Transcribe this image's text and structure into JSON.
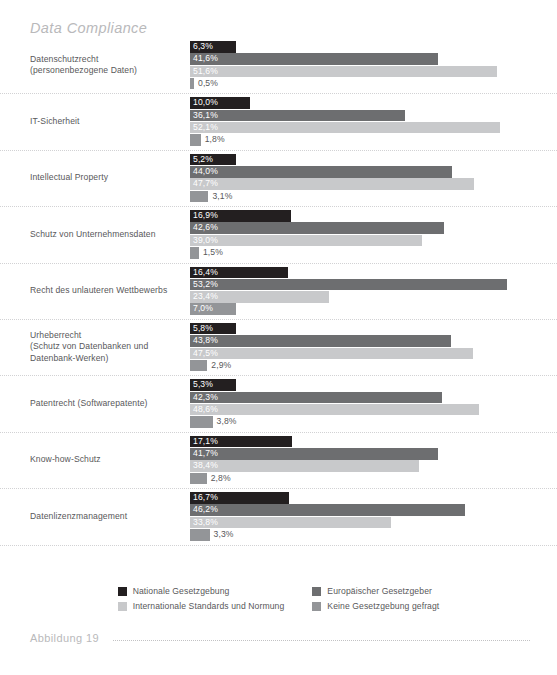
{
  "chart_title": "Data Compliance",
  "footer": {
    "label": "Abbildung 19"
  },
  "legend": {
    "items": [
      {
        "label": "Nationale Gesetzgebung",
        "color": "#231f20"
      },
      {
        "label": "Europäischer Gesetzgeber",
        "color": "#6d6e70"
      },
      {
        "label": "Internationale Standards und Normung",
        "color": "#c8c9cb"
      },
      {
        "label": "Keine Gesetzgebung gefragt",
        "color": "#939598"
      }
    ]
  },
  "chart_data": {
    "type": "bar",
    "orientation": "horizontal",
    "title": "Data Compliance",
    "xlabel": "",
    "ylabel": "",
    "xlim": [
      0,
      55
    ],
    "grid": false,
    "legend_position": "bottom-center",
    "value_suffix": "%",
    "decimal_separator": ",",
    "categories": [
      "Datenschutzrecht\n(personenbezogene Daten)",
      "IT-Sicherheit",
      "Intellectual Property",
      "Schutz von Unternehmensdaten",
      "Recht des unlauteren Wettbewerbs",
      "Urheberrecht\n(Schutz von Datenbanken und\nDatenbank-Werken)",
      "Patentrecht (Softwarepatente)",
      "Know-how-Schutz",
      "Datenlizenzmanagement"
    ],
    "series": [
      {
        "name": "Nationale Gesetzgebung",
        "color": "#231f20",
        "values": [
          6.3,
          10.0,
          5.2,
          16.9,
          16.4,
          5.8,
          5.3,
          17.1,
          16.7
        ]
      },
      {
        "name": "Europäischer Gesetzgeber",
        "color": "#6d6e70",
        "values": [
          41.6,
          36.1,
          44.0,
          42.6,
          53.2,
          43.8,
          42.3,
          41.7,
          46.2
        ]
      },
      {
        "name": "Internationale Standards und Normung",
        "color": "#c8c9cb",
        "values": [
          51.6,
          52.1,
          47.7,
          39.0,
          23.4,
          47.5,
          48.6,
          38.4,
          33.8
        ]
      },
      {
        "name": "Keine Gesetzgebung gefragt",
        "color": "#939598",
        "values": [
          0.5,
          1.8,
          3.1,
          1.5,
          7.0,
          2.9,
          3.8,
          2.8,
          3.3
        ]
      }
    ]
  },
  "rows": [
    {
      "label_lines": [
        "Datenschutzrecht",
        "(personenbezogene Daten)"
      ],
      "bars": [
        {
          "series": 0,
          "value_text": "6,3%",
          "value": 6.3,
          "label_inside": true
        },
        {
          "series": 1,
          "value_text": "41,6%",
          "value": 41.6,
          "label_inside": true
        },
        {
          "series": 2,
          "value_text": "51,6%",
          "value": 51.6,
          "label_inside": true
        },
        {
          "series": 3,
          "value_text": "0,5%",
          "value": 0.5,
          "label_inside": false
        }
      ]
    },
    {
      "label_lines": [
        "IT-Sicherheit"
      ],
      "bars": [
        {
          "series": 0,
          "value_text": "10,0%",
          "value": 10.0,
          "label_inside": true
        },
        {
          "series": 1,
          "value_text": "36,1%",
          "value": 36.1,
          "label_inside": true
        },
        {
          "series": 2,
          "value_text": "52,1%",
          "value": 52.1,
          "label_inside": true
        },
        {
          "series": 3,
          "value_text": "1,8%",
          "value": 1.8,
          "label_inside": false
        }
      ]
    },
    {
      "label_lines": [
        "Intellectual Property"
      ],
      "bars": [
        {
          "series": 0,
          "value_text": "5,2%",
          "value": 5.2,
          "label_inside": true
        },
        {
          "series": 1,
          "value_text": "44,0%",
          "value": 44.0,
          "label_inside": true
        },
        {
          "series": 2,
          "value_text": "47,7%",
          "value": 47.7,
          "label_inside": true
        },
        {
          "series": 3,
          "value_text": "3,1%",
          "value": 3.1,
          "label_inside": false
        }
      ]
    },
    {
      "label_lines": [
        "Schutz von Unternehmensdaten"
      ],
      "bars": [
        {
          "series": 0,
          "value_text": "16,9%",
          "value": 16.9,
          "label_inside": true
        },
        {
          "series": 1,
          "value_text": "42,6%",
          "value": 42.6,
          "label_inside": true
        },
        {
          "series": 2,
          "value_text": "39,0%",
          "value": 39.0,
          "label_inside": true
        },
        {
          "series": 3,
          "value_text": "1,5%",
          "value": 1.5,
          "label_inside": false
        }
      ]
    },
    {
      "label_lines": [
        "Recht des unlauteren Wettbewerbs"
      ],
      "bars": [
        {
          "series": 0,
          "value_text": "16,4%",
          "value": 16.4,
          "label_inside": true
        },
        {
          "series": 1,
          "value_text": "53,2%",
          "value": 53.2,
          "label_inside": true
        },
        {
          "series": 2,
          "value_text": "23,4%",
          "value": 23.4,
          "label_inside": true
        },
        {
          "series": 3,
          "value_text": "7,0%",
          "value": 7.0,
          "label_inside": true
        }
      ]
    },
    {
      "label_lines": [
        "Urheberrecht",
        "(Schutz von Datenbanken und",
        "Datenbank-Werken)"
      ],
      "bars": [
        {
          "series": 0,
          "value_text": "5,8%",
          "value": 5.8,
          "label_inside": true
        },
        {
          "series": 1,
          "value_text": "43,8%",
          "value": 43.8,
          "label_inside": true
        },
        {
          "series": 2,
          "value_text": "47,5%",
          "value": 47.5,
          "label_inside": true
        },
        {
          "series": 3,
          "value_text": "2,9%",
          "value": 2.9,
          "label_inside": false
        }
      ]
    },
    {
      "label_lines": [
        "Patentrecht (Softwarepatente)"
      ],
      "bars": [
        {
          "series": 0,
          "value_text": "5,3%",
          "value": 5.3,
          "label_inside": true
        },
        {
          "series": 1,
          "value_text": "42,3%",
          "value": 42.3,
          "label_inside": true
        },
        {
          "series": 2,
          "value_text": "48,6%",
          "value": 48.6,
          "label_inside": true
        },
        {
          "series": 3,
          "value_text": "3,8%",
          "value": 3.8,
          "label_inside": false
        }
      ]
    },
    {
      "label_lines": [
        "Know-how-Schutz"
      ],
      "bars": [
        {
          "series": 0,
          "value_text": "17,1%",
          "value": 17.1,
          "label_inside": true
        },
        {
          "series": 1,
          "value_text": "41,7%",
          "value": 41.7,
          "label_inside": true
        },
        {
          "series": 2,
          "value_text": "38,4%",
          "value": 38.4,
          "label_inside": true
        },
        {
          "series": 3,
          "value_text": "2,8%",
          "value": 2.8,
          "label_inside": false
        }
      ]
    },
    {
      "label_lines": [
        "Datenlizenzmanagement"
      ],
      "bars": [
        {
          "series": 0,
          "value_text": "16,7%",
          "value": 16.7,
          "label_inside": true
        },
        {
          "series": 1,
          "value_text": "46,2%",
          "value": 46.2,
          "label_inside": true
        },
        {
          "series": 2,
          "value_text": "33,8%",
          "value": 33.8,
          "label_inside": true
        },
        {
          "series": 3,
          "value_text": "3,3%",
          "value": 3.3,
          "label_inside": false
        }
      ]
    }
  ]
}
